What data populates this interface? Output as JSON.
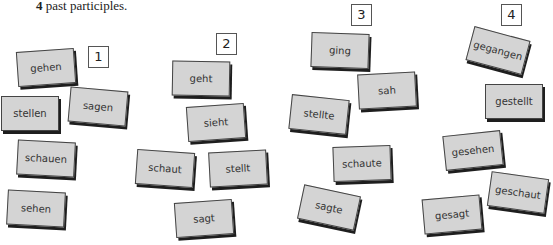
{
  "instruction": {
    "number": "4",
    "text": " past participles."
  },
  "groups": [
    {
      "label": "1",
      "position": {
        "left": 88,
        "top": 46
      }
    },
    {
      "label": "2",
      "position": {
        "left": 216,
        "top": 33
      }
    },
    {
      "label": "3",
      "position": {
        "left": 351,
        "top": 4
      }
    },
    {
      "label": "4",
      "position": {
        "left": 501,
        "top": 4
      }
    }
  ],
  "cards": [
    {
      "word": "gehen",
      "left": 17,
      "top": 50,
      "rotate": -4
    },
    {
      "word": "stellen",
      "left": 1,
      "top": 96,
      "rotate": 0
    },
    {
      "word": "sagen",
      "left": 69,
      "top": 89,
      "rotate": 5
    },
    {
      "word": "schauen",
      "left": 17,
      "top": 141,
      "rotate": 3
    },
    {
      "word": "sehen",
      "left": 7,
      "top": 191,
      "rotate": 3
    },
    {
      "word": "geht",
      "left": 172,
      "top": 61,
      "rotate": 1
    },
    {
      "word": "sieht",
      "left": 187,
      "top": 105,
      "rotate": -4
    },
    {
      "word": "schaut",
      "left": 136,
      "top": 151,
      "rotate": 4
    },
    {
      "word": "stellt",
      "left": 209,
      "top": 151,
      "rotate": -3
    },
    {
      "word": "sagt",
      "left": 175,
      "top": 201,
      "rotate": -4
    },
    {
      "word": "ging",
      "left": 311,
      "top": 33,
      "rotate": 2
    },
    {
      "word": "sah",
      "left": 358,
      "top": 73,
      "rotate": -3
    },
    {
      "word": "stellte",
      "left": 290,
      "top": 97,
      "rotate": 6
    },
    {
      "word": "schaute",
      "left": 333,
      "top": 146,
      "rotate": -2
    },
    {
      "word": "sagte",
      "left": 300,
      "top": 190,
      "rotate": 12
    },
    {
      "word": "gegangen",
      "left": 469,
      "top": 33,
      "rotate": 15
    },
    {
      "word": "gestellt",
      "left": 485,
      "top": 84,
      "rotate": 0
    },
    {
      "word": "gesehen",
      "left": 444,
      "top": 133,
      "rotate": -6
    },
    {
      "word": "geschaut",
      "left": 489,
      "top": 175,
      "rotate": 8
    },
    {
      "word": "gesagt",
      "left": 423,
      "top": 197,
      "rotate": -5
    }
  ]
}
